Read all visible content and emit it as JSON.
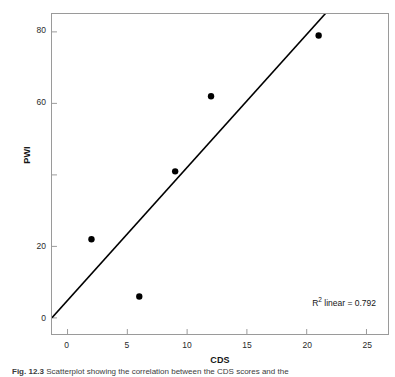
{
  "figure": {
    "caption_label": "Fig. 12.3",
    "caption_text": "Scatterplot showing the correlation between the CDS scores and the",
    "r2_annotation_prefix": "R",
    "r2_annotation_exponent": "2",
    "r2_annotation_suffix": " linear = 0.792"
  },
  "chart_data": {
    "type": "scatter",
    "title": "",
    "xlabel": "CDS",
    "ylabel": "PWI",
    "xlim": [
      -1.3,
      26.8
    ],
    "ylim": [
      -4.5,
      85.0
    ],
    "xticks": [
      0,
      5,
      10,
      15,
      20,
      25
    ],
    "xtick_labels": [
      "0",
      "5",
      "10",
      "15",
      "20",
      "25"
    ],
    "yticks": [
      0,
      20,
      40,
      60,
      80
    ],
    "ytick_labels": [
      "0",
      "20",
      "",
      "60",
      "80"
    ],
    "grid": false,
    "legend": false,
    "marker_color": "#000000",
    "line_color": "#000000",
    "frame_color": "#9a9a9a",
    "points": [
      {
        "x": 2,
        "y": 22
      },
      {
        "x": 6,
        "y": 6
      },
      {
        "x": 9,
        "y": 41
      },
      {
        "x": 12,
        "y": 62
      },
      {
        "x": 21,
        "y": 79
      }
    ],
    "series": [
      {
        "name": "PWI vs CDS",
        "x": [
          2,
          6,
          9,
          12,
          21
        ],
        "y": [
          22,
          6,
          41,
          62,
          79
        ]
      }
    ],
    "fit_line": {
      "type": "linear",
      "r_squared": 0.792,
      "slope": 3.72,
      "intercept": 4.9,
      "x_start": -1.3,
      "x_end": 21.7
    },
    "annotations": [
      {
        "text": "R2 linear = 0.792",
        "x": 21.0,
        "y": 9.0
      }
    ]
  },
  "axes": {
    "y_labels": [
      {
        "value": 80,
        "text": "80"
      },
      {
        "value": 60,
        "text": "60"
      },
      {
        "value": 40,
        "text": ""
      },
      {
        "value": 20,
        "text": "20"
      },
      {
        "value": 0,
        "text": "0"
      }
    ],
    "x_labels": [
      {
        "value": 0,
        "text": "0"
      },
      {
        "value": 5,
        "text": "5"
      },
      {
        "value": 10,
        "text": "10"
      },
      {
        "value": 15,
        "text": "15"
      },
      {
        "value": 20,
        "text": "20"
      },
      {
        "value": 25,
        "text": "25"
      }
    ]
  }
}
